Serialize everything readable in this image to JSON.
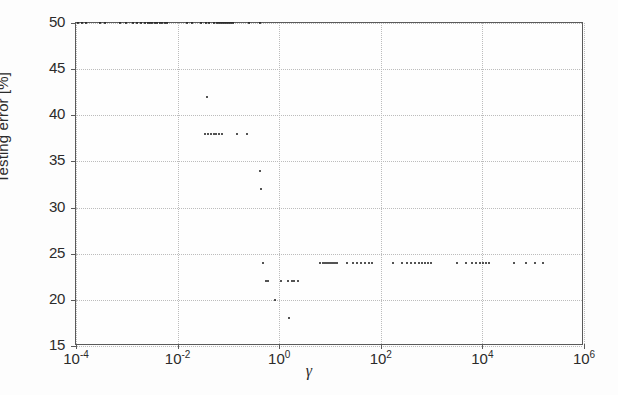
{
  "chart_data": {
    "type": "scatter",
    "title": "",
    "xlabel": "γ",
    "ylabel": "Testing error [%]",
    "xscale": "log",
    "yscale": "linear",
    "xlim": [
      0.0001,
      1000000
    ],
    "ylim": [
      15,
      50
    ],
    "grid": true,
    "legend": null,
    "marker": "dot",
    "marker_color": "#1a1a1a",
    "xticks": [
      {
        "value": 0.0001,
        "label": "10",
        "exponent": "-4"
      },
      {
        "value": 0.01,
        "label": "10",
        "exponent": "-2"
      },
      {
        "value": 1,
        "label": "10",
        "exponent": "0"
      },
      {
        "value": 100,
        "label": "10",
        "exponent": "2"
      },
      {
        "value": 10000,
        "label": "10",
        "exponent": "4"
      },
      {
        "value": 1000000,
        "label": "10",
        "exponent": "6"
      }
    ],
    "yticks": [
      15,
      20,
      25,
      30,
      35,
      40,
      45,
      50
    ],
    "series": [
      {
        "name": "testing error",
        "points": [
          [
            0.00011,
            50
          ],
          [
            0.00013,
            50
          ],
          [
            0.00016,
            50
          ],
          [
            0.0003,
            50
          ],
          [
            0.00038,
            50
          ],
          [
            0.00075,
            50
          ],
          [
            0.00095,
            50
          ],
          [
            0.0013,
            50
          ],
          [
            0.0016,
            50
          ],
          [
            0.0019,
            50
          ],
          [
            0.0023,
            50
          ],
          [
            0.0026,
            50
          ],
          [
            0.0029,
            50
          ],
          [
            0.0032,
            50
          ],
          [
            0.0036,
            50
          ],
          [
            0.004,
            50
          ],
          [
            0.0045,
            50
          ],
          [
            0.005,
            50
          ],
          [
            0.0056,
            50
          ],
          [
            0.0062,
            50
          ],
          [
            0.015,
            50
          ],
          [
            0.0195,
            50
          ],
          [
            0.029,
            50
          ],
          [
            0.036,
            50
          ],
          [
            0.042,
            50
          ],
          [
            0.052,
            50
          ],
          [
            0.059,
            50
          ],
          [
            0.065,
            50
          ],
          [
            0.072,
            50
          ],
          [
            0.079,
            50
          ],
          [
            0.087,
            50
          ],
          [
            0.095,
            50
          ],
          [
            0.103,
            50
          ],
          [
            0.112,
            50
          ],
          [
            0.123,
            50
          ],
          [
            0.26,
            50
          ],
          [
            0.42,
            50
          ],
          [
            0.038,
            42
          ],
          [
            0.034,
            38
          ],
          [
            0.039,
            38
          ],
          [
            0.045,
            38
          ],
          [
            0.051,
            38
          ],
          [
            0.058,
            38
          ],
          [
            0.066,
            38
          ],
          [
            0.074,
            38
          ],
          [
            0.15,
            38
          ],
          [
            0.23,
            38
          ],
          [
            0.42,
            34
          ],
          [
            0.44,
            32
          ],
          [
            0.47,
            24
          ],
          [
            0.54,
            22
          ],
          [
            0.59,
            22
          ],
          [
            0.82,
            20
          ],
          [
            1.55,
            18
          ],
          [
            1.1,
            22
          ],
          [
            1.5,
            22
          ],
          [
            1.8,
            22
          ],
          [
            2.0,
            22
          ],
          [
            2.3,
            22
          ],
          [
            6.5,
            24
          ],
          [
            7.3,
            24
          ],
          [
            8.0,
            24
          ],
          [
            8.8,
            24
          ],
          [
            9.6,
            24
          ],
          [
            10.5,
            24
          ],
          [
            11.5,
            24
          ],
          [
            12.6,
            24
          ],
          [
            13.8,
            24
          ],
          [
            22.0,
            24
          ],
          [
            28.0,
            24
          ],
          [
            34.0,
            24
          ],
          [
            41.0,
            24
          ],
          [
            49.0,
            24
          ],
          [
            58.0,
            24
          ],
          [
            68.0,
            24
          ],
          [
            175.0,
            24
          ],
          [
            260.0,
            24
          ],
          [
            330.0,
            24
          ],
          [
            400.0,
            24
          ],
          [
            480.0,
            24
          ],
          [
            560.0,
            24
          ],
          [
            650.0,
            24
          ],
          [
            750.0,
            24
          ],
          [
            860.0,
            24
          ],
          [
            980.0,
            24
          ],
          [
            3200.0,
            24
          ],
          [
            4800.0,
            24
          ],
          [
            6200.0,
            24
          ],
          [
            7500.0,
            24
          ],
          [
            8800.0,
            24
          ],
          [
            10200.0,
            24
          ],
          [
            11800.0,
            24
          ],
          [
            13500.0,
            24
          ],
          [
            42000.0,
            24
          ],
          [
            72000.0,
            24
          ],
          [
            110000.0,
            24
          ],
          [
            155000.0,
            24
          ]
        ]
      }
    ]
  },
  "axes": {
    "y_title": "Testing error [%]",
    "x_title": "γ"
  }
}
